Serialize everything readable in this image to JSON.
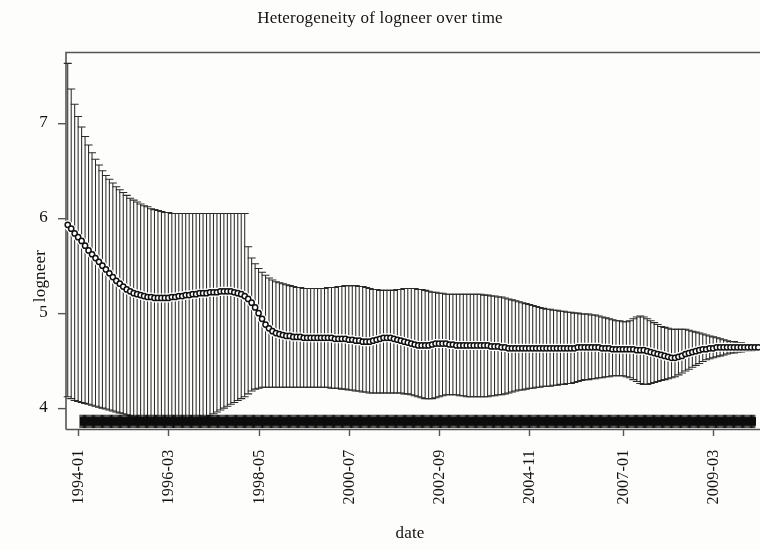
{
  "chart_data": {
    "type": "line",
    "title": "Heterogeneity of logneer over time",
    "xlabel": "date",
    "ylabel": "logneer",
    "grid": false,
    "legend": null,
    "ylim": [
      3.78,
      7.75
    ],
    "yticks": [
      4,
      5,
      6,
      7
    ],
    "yticklabels": [
      "4",
      "5",
      "6",
      "7"
    ],
    "xticklabels": [
      "1994-01",
      "1996-03",
      "1998-05",
      "2000-07",
      "2002-09",
      "2004-11",
      "2007-01",
      "2009-03"
    ],
    "xtick_positions": [
      3,
      29,
      55,
      81,
      107,
      133,
      160,
      186
    ],
    "n_points": 200,
    "series": [
      {
        "name": "mean logneer",
        "marker": "circle",
        "values": [
          5.93,
          5.89,
          5.84,
          5.8,
          5.76,
          5.71,
          5.66,
          5.62,
          5.58,
          5.54,
          5.5,
          5.46,
          5.42,
          5.38,
          5.34,
          5.31,
          5.28,
          5.25,
          5.23,
          5.21,
          5.2,
          5.19,
          5.18,
          5.17,
          5.17,
          5.16,
          5.16,
          5.16,
          5.16,
          5.16,
          5.17,
          5.17,
          5.18,
          5.18,
          5.19,
          5.19,
          5.2,
          5.2,
          5.21,
          5.21,
          5.21,
          5.22,
          5.22,
          5.22,
          5.23,
          5.23,
          5.23,
          5.23,
          5.22,
          5.21,
          5.2,
          5.18,
          5.15,
          5.11,
          5.06,
          5.0,
          4.94,
          4.88,
          4.84,
          4.81,
          4.79,
          4.78,
          4.77,
          4.76,
          4.76,
          4.75,
          4.75,
          4.75,
          4.74,
          4.74,
          4.74,
          4.74,
          4.74,
          4.74,
          4.74,
          4.74,
          4.74,
          4.73,
          4.73,
          4.73,
          4.73,
          4.72,
          4.72,
          4.71,
          4.71,
          4.7,
          4.7,
          4.7,
          4.71,
          4.72,
          4.73,
          4.74,
          4.74,
          4.74,
          4.73,
          4.72,
          4.71,
          4.7,
          4.69,
          4.68,
          4.67,
          4.66,
          4.66,
          4.66,
          4.66,
          4.67,
          4.68,
          4.68,
          4.68,
          4.68,
          4.67,
          4.67,
          4.66,
          4.66,
          4.66,
          4.66,
          4.66,
          4.66,
          4.66,
          4.66,
          4.66,
          4.66,
          4.65,
          4.65,
          4.65,
          4.64,
          4.64,
          4.63,
          4.63,
          4.63,
          4.63,
          4.63,
          4.63,
          4.63,
          4.63,
          4.63,
          4.63,
          4.63,
          4.63,
          4.63,
          4.63,
          4.63,
          4.63,
          4.63,
          4.63,
          4.63,
          4.63,
          4.64,
          4.64,
          4.64,
          4.64,
          4.64,
          4.64,
          4.64,
          4.63,
          4.63,
          4.63,
          4.62,
          4.62,
          4.62,
          4.62,
          4.62,
          4.62,
          4.62,
          4.61,
          4.61,
          4.61,
          4.6,
          4.59,
          4.58,
          4.57,
          4.56,
          4.55,
          4.54,
          4.53,
          4.53,
          4.54,
          4.55,
          4.57,
          4.58,
          4.59,
          4.6,
          4.61,
          4.62,
          4.62,
          4.63,
          4.63,
          4.64,
          4.64,
          4.64,
          4.64,
          4.64,
          4.64,
          4.64,
          4.64,
          4.64,
          4.64,
          4.64,
          4.64,
          4.64
        ],
        "ci_upper": [
          7.63,
          7.36,
          7.2,
          7.07,
          6.96,
          6.86,
          6.77,
          6.69,
          6.62,
          6.56,
          6.5,
          6.45,
          6.41,
          6.37,
          6.33,
          6.3,
          6.27,
          6.24,
          6.21,
          6.19,
          6.17,
          6.15,
          6.13,
          6.12,
          6.1,
          6.09,
          6.08,
          6.07,
          6.06,
          6.06,
          6.05,
          6.05,
          6.05,
          6.05,
          6.05,
          6.05,
          6.05,
          6.05,
          6.05,
          6.05,
          6.05,
          6.05,
          6.05,
          6.05,
          6.05,
          6.05,
          6.05,
          6.05,
          6.05,
          6.05,
          6.05,
          6.05,
          5.7,
          5.58,
          5.52,
          5.47,
          5.43,
          5.4,
          5.37,
          5.35,
          5.33,
          5.32,
          5.31,
          5.3,
          5.29,
          5.28,
          5.27,
          5.27,
          5.26,
          5.26,
          5.26,
          5.26,
          5.26,
          5.26,
          5.26,
          5.27,
          5.27,
          5.27,
          5.28,
          5.28,
          5.29,
          5.29,
          5.29,
          5.29,
          5.28,
          5.28,
          5.27,
          5.26,
          5.25,
          5.25,
          5.24,
          5.24,
          5.24,
          5.24,
          5.24,
          5.25,
          5.25,
          5.26,
          5.26,
          5.26,
          5.26,
          5.25,
          5.25,
          5.24,
          5.23,
          5.22,
          5.22,
          5.21,
          5.21,
          5.2,
          5.2,
          5.2,
          5.2,
          5.2,
          5.2,
          5.2,
          5.2,
          5.2,
          5.2,
          5.2,
          5.19,
          5.19,
          5.18,
          5.18,
          5.17,
          5.17,
          5.16,
          5.15,
          5.14,
          5.13,
          5.12,
          5.11,
          5.1,
          5.09,
          5.08,
          5.07,
          5.06,
          5.05,
          5.04,
          5.04,
          5.03,
          5.03,
          5.02,
          5.02,
          5.01,
          5.01,
          5.0,
          5.0,
          4.99,
          4.99,
          4.99,
          4.98,
          4.98,
          4.97,
          4.96,
          4.95,
          4.94,
          4.93,
          4.92,
          4.92,
          4.91,
          4.91,
          4.92,
          4.94,
          4.96,
          4.97,
          4.96,
          4.94,
          4.92,
          4.9,
          4.88,
          4.86,
          4.85,
          4.84,
          4.83,
          4.83,
          4.83,
          4.83,
          4.83,
          4.82,
          4.81,
          4.8,
          4.79,
          4.78,
          4.77,
          4.76,
          4.75,
          4.74,
          4.73,
          4.72,
          4.71,
          4.7,
          4.7,
          4.69,
          4.69,
          4.68,
          4.68,
          4.67,
          4.67,
          4.67
        ],
        "ci_lower": [
          4.12,
          4.1,
          4.08,
          4.07,
          4.06,
          4.05,
          4.04,
          4.03,
          4.02,
          4.01,
          4.0,
          3.99,
          3.98,
          3.97,
          3.96,
          3.95,
          3.94,
          3.93,
          3.92,
          3.91,
          3.9,
          3.9,
          3.89,
          3.89,
          3.88,
          3.88,
          3.88,
          3.88,
          3.88,
          3.88,
          3.88,
          3.88,
          3.88,
          3.88,
          3.88,
          3.88,
          3.88,
          3.89,
          3.89,
          3.9,
          3.91,
          3.92,
          3.94,
          3.96,
          3.98,
          4.0,
          4.02,
          4.04,
          4.06,
          4.08,
          4.1,
          4.12,
          4.15,
          4.18,
          4.2,
          4.21,
          4.22,
          4.22,
          4.22,
          4.22,
          4.22,
          4.22,
          4.22,
          4.22,
          4.22,
          4.22,
          4.22,
          4.22,
          4.22,
          4.22,
          4.22,
          4.22,
          4.22,
          4.22,
          4.22,
          4.22,
          4.21,
          4.21,
          4.21,
          4.2,
          4.2,
          4.19,
          4.19,
          4.18,
          4.18,
          4.17,
          4.17,
          4.16,
          4.16,
          4.16,
          4.16,
          4.16,
          4.16,
          4.16,
          4.16,
          4.16,
          4.16,
          4.15,
          4.15,
          4.14,
          4.13,
          4.12,
          4.11,
          4.1,
          4.1,
          4.1,
          4.11,
          4.12,
          4.13,
          4.14,
          4.14,
          4.14,
          4.14,
          4.13,
          4.13,
          4.12,
          4.12,
          4.12,
          4.12,
          4.12,
          4.12,
          4.12,
          4.13,
          4.13,
          4.14,
          4.14,
          4.15,
          4.16,
          4.17,
          4.18,
          4.19,
          4.19,
          4.2,
          4.21,
          4.21,
          4.22,
          4.22,
          4.23,
          4.23,
          4.23,
          4.24,
          4.24,
          4.25,
          4.25,
          4.26,
          4.26,
          4.27,
          4.28,
          4.29,
          4.3,
          4.3,
          4.31,
          4.31,
          4.32,
          4.32,
          4.33,
          4.33,
          4.34,
          4.34,
          4.34,
          4.34,
          4.33,
          4.32,
          4.3,
          4.28,
          4.26,
          4.25,
          4.25,
          4.26,
          4.27,
          4.28,
          4.29,
          4.3,
          4.31,
          4.32,
          4.33,
          4.35,
          4.37,
          4.39,
          4.41,
          4.43,
          4.45,
          4.47,
          4.49,
          4.51,
          4.52,
          4.53,
          4.54,
          4.55,
          4.56,
          4.57,
          4.58,
          4.58,
          4.59,
          4.59,
          4.6,
          4.6,
          4.6,
          4.61,
          4.61
        ]
      }
    ],
    "rug": {
      "name": "observation density",
      "value": 3.86,
      "thickness": 0.09
    },
    "colors": {
      "line": "#101010",
      "errorbar": "#2b2b2b",
      "frame": "#555555",
      "background": "#fdfdfb"
    }
  }
}
